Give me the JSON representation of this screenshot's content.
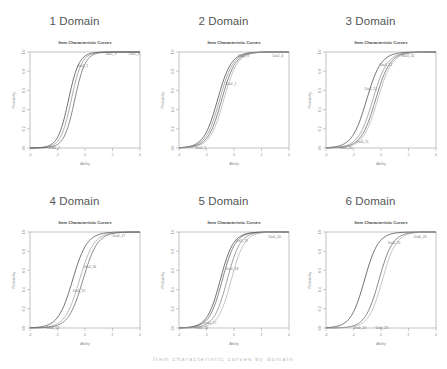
{
  "figure": {
    "caption": "Item characteristic curves by domain"
  },
  "chart_data": [
    {
      "type": "line",
      "panel_title": "1 Domain",
      "title": "Item Characteristic Curves",
      "xlabel": "Ability",
      "ylabel": "Probability",
      "xlim": [
        -4,
        4
      ],
      "ylim": [
        0,
        1
      ],
      "xticks": [
        "-4",
        "-2",
        "0",
        "2",
        "4"
      ],
      "yticks": [
        "0.0",
        "0.2",
        "0.4",
        "0.6",
        "0.8",
        "1.0"
      ],
      "grid": false,
      "curve_model": "logistic: P(theta) = 1 / (1 + exp(-a (theta - b)))",
      "series": [
        {
          "name": "Dia1_4",
          "a": 2.6,
          "b": -1.2,
          "color": "#333333"
        },
        {
          "name": "Dia1_3",
          "a": 2.6,
          "b": -1.0,
          "color": "#888888"
        },
        {
          "name": "Dia1_2",
          "a": 2.6,
          "b": -0.75,
          "color": "#555555"
        }
      ],
      "labels": [
        {
          "text": "Dia1_4",
          "x": 3.2,
          "y": 0.97
        },
        {
          "text": "Dia1_3",
          "x": 1.5,
          "y": 0.97
        },
        {
          "text": "Dia1_2",
          "x": -0.55,
          "y": 0.84
        },
        {
          "text": "Dia1_1",
          "x": -2.6,
          "y": -0.01
        }
      ]
    },
    {
      "type": "line",
      "panel_title": "2 Domain",
      "title": "Item Characteristic Curves",
      "xlabel": "Ability",
      "ylabel": "Probability",
      "xlim": [
        -4,
        4
      ],
      "ylim": [
        0,
        1
      ],
      "xticks": [
        "-4",
        "-2",
        "0",
        "2",
        "4"
      ],
      "yticks": [
        "0.0",
        "0.2",
        "0.4",
        "0.6",
        "0.8",
        "1.0"
      ],
      "grid": false,
      "series": [
        {
          "name": "Dia2_1",
          "a": 2.0,
          "b": -1.2,
          "color": "#333333"
        },
        {
          "name": "Dia2_2",
          "a": 2.0,
          "b": -1.05,
          "color": "#888888"
        },
        {
          "name": "Dia2_3",
          "a": 2.0,
          "b": -0.9,
          "color": "#555555"
        },
        {
          "name": "Dia2_4",
          "a": 2.0,
          "b": -0.75,
          "color": "#aaaaaa"
        }
      ],
      "labels": [
        {
          "text": "Dia2_4",
          "x": 2.8,
          "y": 0.95
        },
        {
          "text": "Dia2_3",
          "x": 0.3,
          "y": 0.95
        },
        {
          "text": "Dia2_2",
          "x": -0.6,
          "y": 0.66
        },
        {
          "text": "Dia2_1",
          "x": -2.8,
          "y": -0.01
        }
      ]
    },
    {
      "type": "line",
      "panel_title": "3 Domain",
      "title": "Item Characteristic Curves",
      "xlabel": "Ability",
      "ylabel": "Probability",
      "xlim": [
        -4,
        4
      ],
      "ylim": [
        0,
        1
      ],
      "xticks": [
        "-4",
        "-2",
        "0",
        "2",
        "4"
      ],
      "yticks": [
        "0.0",
        "0.2",
        "0.4",
        "0.6",
        "0.8",
        "1.0"
      ],
      "grid": false,
      "series": [
        {
          "name": "Dia3_1",
          "a": 1.9,
          "b": -1.05,
          "color": "#333333"
        },
        {
          "name": "Dia3_2",
          "a": 1.9,
          "b": -0.6,
          "color": "#888888"
        },
        {
          "name": "Dia3_3",
          "a": 1.9,
          "b": -0.4,
          "color": "#555555"
        },
        {
          "name": "Dia3_4",
          "a": 1.9,
          "b": -0.25,
          "color": "#aaaaaa"
        }
      ],
      "labels": [
        {
          "text": "Dia3_14",
          "x": 1.5,
          "y": 0.95
        },
        {
          "text": "Dia3_13",
          "x": -0.1,
          "y": 0.85
        },
        {
          "text": "Dia3_12",
          "x": -1.2,
          "y": 0.6
        },
        {
          "text": "Dia3_11",
          "x": -1.8,
          "y": 0.05
        },
        {
          "text": "Dia3_10",
          "x": -3.0,
          "y": -0.01
        }
      ]
    },
    {
      "type": "line",
      "panel_title": "4 Domain",
      "title": "Item Characteristic Curves",
      "xlabel": "Ability",
      "ylabel": "Probability",
      "xlim": [
        -4,
        4
      ],
      "ylim": [
        0,
        1
      ],
      "xticks": [
        "-4",
        "-2",
        "0",
        "2",
        "4"
      ],
      "yticks": [
        "0.0",
        "0.2",
        "0.4",
        "0.6",
        "0.8",
        "1.0"
      ],
      "grid": false,
      "series": [
        {
          "name": "Dia4_1",
          "a": 1.9,
          "b": -0.9,
          "color": "#333333"
        },
        {
          "name": "Dia4_2",
          "a": 1.9,
          "b": -0.4,
          "color": "#999999"
        },
        {
          "name": "Dia4_3",
          "a": 1.9,
          "b": -0.15,
          "color": "#555555"
        }
      ],
      "labels": [
        {
          "text": "Dia4_17",
          "x": 2.0,
          "y": 0.95
        },
        {
          "text": "Dia4_16",
          "x": -0.1,
          "y": 0.62
        },
        {
          "text": "Dia4_15",
          "x": -0.9,
          "y": 0.38
        },
        {
          "text": "Dia4_14",
          "x": -2.8,
          "y": -0.01
        }
      ]
    },
    {
      "type": "line",
      "panel_title": "5 Domain",
      "title": "Item Characteristic Curves",
      "xlabel": "Ability",
      "ylabel": "Probability",
      "xlim": [
        -4,
        4
      ],
      "ylim": [
        0,
        1
      ],
      "xticks": [
        "-4",
        "-2",
        "0",
        "2",
        "4"
      ],
      "yticks": [
        "0.0",
        "0.2",
        "0.4",
        "0.6",
        "0.8",
        "1.0"
      ],
      "grid": false,
      "series": [
        {
          "name": "Dia5_1",
          "a": 2.1,
          "b": -1.0,
          "color": "#333333"
        },
        {
          "name": "Dia5_2",
          "a": 2.1,
          "b": -0.85,
          "color": "#555555"
        },
        {
          "name": "Dia5_3",
          "a": 2.1,
          "b": -0.5,
          "color": "#777777"
        },
        {
          "name": "Dia5_4",
          "a": 2.1,
          "b": -0.2,
          "color": "#aaaaaa"
        }
      ],
      "labels": [
        {
          "text": "Dia5_20",
          "x": 2.5,
          "y": 0.94
        },
        {
          "text": "Dia5_19",
          "x": 0.1,
          "y": 0.9
        },
        {
          "text": "Dia5_18",
          "x": -0.6,
          "y": 0.6
        },
        {
          "text": "Dia5_17",
          "x": -2.2,
          "y": 0.04
        },
        {
          "text": "Dia5_16",
          "x": -2.8,
          "y": -0.01
        }
      ]
    },
    {
      "type": "line",
      "panel_title": "6 Domain",
      "title": "Item Characteristic Curves",
      "xlabel": "Ability",
      "ylabel": "Probability",
      "xlim": [
        -4,
        4
      ],
      "ylim": [
        0,
        1
      ],
      "xticks": [
        "-4",
        "-2",
        "0",
        "2",
        "4"
      ],
      "yticks": [
        "0.0",
        "0.2",
        "0.4",
        "0.6",
        "0.8",
        "1.0"
      ],
      "grid": false,
      "series": [
        {
          "name": "Dia6_1",
          "a": 2.0,
          "b": -1.2,
          "color": "#333333"
        },
        {
          "name": "Dia6_2",
          "a": 2.0,
          "b": -0.15,
          "color": "#555555"
        },
        {
          "name": "Dia6_3",
          "a": 2.0,
          "b": 0.1,
          "color": "#aaaaaa"
        }
      ],
      "labels": [
        {
          "text": "Dia6_26",
          "x": 2.4,
          "y": 0.94
        },
        {
          "text": "Dia6_25",
          "x": 0.5,
          "y": 0.88
        },
        {
          "text": "Dia6_24",
          "x": -2.0,
          "y": -0.01
        },
        {
          "text": "Dia6_23",
          "x": -0.4,
          "y": -0.01
        }
      ]
    }
  ]
}
